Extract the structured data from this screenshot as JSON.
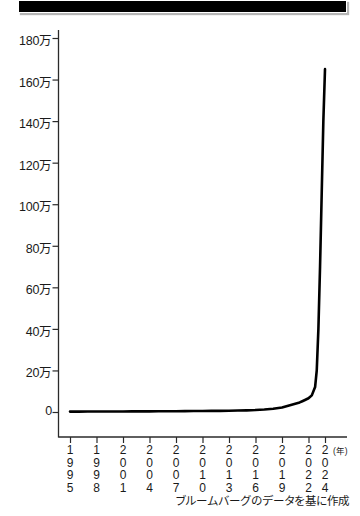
{
  "title_band": {
    "label": "headline-banner"
  },
  "chart_data": {
    "type": "line",
    "title": "",
    "subtitle": "",
    "xlabel": "",
    "ylabel": "",
    "x_unit_label": "(年)",
    "grid": false,
    "legend": null,
    "source_note": "ブルームバーグのデータを基に作成",
    "ylim": [
      0,
      180000
    ],
    "ytick_labels": [
      "180万",
      "160万",
      "140万",
      "120万",
      "100万",
      "80万",
      "60万",
      "40万",
      "20万",
      "0"
    ],
    "ytick_values": [
      1800000,
      1600000,
      1400000,
      1200000,
      1000000,
      800000,
      600000,
      400000,
      200000,
      0
    ],
    "xtick_labels": [
      "1995",
      "1998",
      "2001",
      "2004",
      "2007",
      "2010",
      "2013",
      "2016",
      "2019",
      "2022",
      "2024"
    ],
    "xtick_values": [
      1995,
      1998,
      2001,
      2004,
      2007,
      2010,
      2013,
      2016,
      2019,
      2022,
      2024
    ],
    "xlim": [
      1995,
      2024
    ],
    "series": [
      {
        "name": "value",
        "x": [
          1995,
          1996,
          1997,
          1998,
          1999,
          2000,
          2001,
          2002,
          2003,
          2004,
          2005,
          2006,
          2007,
          2008,
          2009,
          2010,
          2011,
          2012,
          2013,
          2014,
          2015,
          2016,
          2017,
          2018,
          2019,
          2019.5,
          2020,
          2020.5,
          2021,
          2021.3,
          2021.6,
          2022,
          2022.4,
          2022.8,
          2023,
          2023.2,
          2023.4,
          2023.6,
          2023.8,
          2024
        ],
        "values": [
          2000,
          2000,
          2200,
          2300,
          2500,
          2600,
          2700,
          2800,
          3000,
          3200,
          3400,
          3600,
          3900,
          4200,
          4500,
          4800,
          5200,
          5600,
          6200,
          7000,
          8000,
          9500,
          12000,
          16000,
          22000,
          28000,
          34000,
          40000,
          46000,
          52000,
          58000,
          66000,
          80000,
          120000,
          200000,
          400000,
          700000,
          1050000,
          1400000,
          1650000
        ]
      }
    ]
  }
}
